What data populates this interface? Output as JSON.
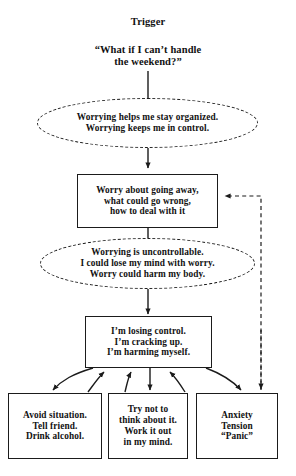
{
  "diagram": {
    "type": "flowchart",
    "colors": {
      "stroke": "#1b1b1b",
      "background": "#ffffff",
      "text": "#121212"
    },
    "nodes": [
      {
        "id": "trigger-title",
        "shape": "text",
        "lines": [
          "Trigger"
        ]
      },
      {
        "id": "trigger-thought",
        "shape": "text",
        "lines": [
          "“What if I can’t handle",
          "the weekend?”"
        ]
      },
      {
        "id": "positive-beliefs",
        "shape": "dashed-ellipse",
        "lines": [
          "Worrying helps me stay organized.",
          "Worrying keeps me in control."
        ]
      },
      {
        "id": "worry-process",
        "shape": "rectangle",
        "lines": [
          "Worry about going away,",
          "what could go wrong,",
          "how to deal with it"
        ]
      },
      {
        "id": "negative-beliefs",
        "shape": "dashed-ellipse",
        "lines": [
          "Worrying is uncontrollable.",
          "I could lose my mind with worry.",
          "Worry could harm my body."
        ]
      },
      {
        "id": "appraisal",
        "shape": "rectangle",
        "lines": [
          "I’m losing control.",
          "I’m cracking up.",
          "I’m harming myself."
        ]
      },
      {
        "id": "behaviour",
        "shape": "rectangle",
        "lines": [
          "Avoid situation.",
          "Tell friend.",
          "Drink alcohol."
        ]
      },
      {
        "id": "thought-control",
        "shape": "rectangle",
        "lines": [
          "Try not to",
          "think about it.",
          "Work it out",
          "in my mind."
        ]
      },
      {
        "id": "emotion",
        "shape": "rectangle",
        "lines": [
          "Anxiety",
          "Tension",
          "“Panic”"
        ]
      }
    ],
    "edges": [
      {
        "id": "trigger-to-positive",
        "from": "trigger-thought",
        "to": "positive-beliefs",
        "style": "solid",
        "arrow": "none"
      },
      {
        "id": "positive-to-worry",
        "from": "positive-beliefs",
        "to": "worry-process",
        "style": "solid",
        "arrow": "down"
      },
      {
        "id": "worry-to-negative",
        "from": "worry-process",
        "to": "negative-beliefs",
        "style": "solid",
        "arrow": "none"
      },
      {
        "id": "negative-to-appraisal",
        "from": "negative-beliefs",
        "to": "appraisal",
        "style": "solid",
        "arrow": "down"
      },
      {
        "id": "appraisal-to-behaviour",
        "from": "appraisal",
        "to": "behaviour",
        "style": "solid-curved",
        "arrow": "down"
      },
      {
        "id": "behaviour-to-appraisal",
        "from": "behaviour",
        "to": "appraisal",
        "style": "solid-curved",
        "arrow": "up"
      },
      {
        "id": "appraisal-to-thought-control",
        "from": "appraisal",
        "to": "thought-control",
        "style": "solid",
        "arrow": "down"
      },
      {
        "id": "thought-control-to-appraisal",
        "from": "thought-control",
        "to": "appraisal",
        "style": "solid-curved",
        "arrow": "up"
      },
      {
        "id": "appraisal-to-emotion",
        "from": "appraisal",
        "to": "emotion",
        "style": "solid-curved",
        "arrow": "down"
      },
      {
        "id": "emotion-to-appraisal",
        "from": "emotion",
        "to": "appraisal",
        "style": "solid-curved",
        "arrow": "up"
      },
      {
        "id": "emotion-feedback-to-worry",
        "from": "emotion",
        "to": "worry-process",
        "style": "dashed",
        "arrow": "left-and-down"
      }
    ]
  }
}
